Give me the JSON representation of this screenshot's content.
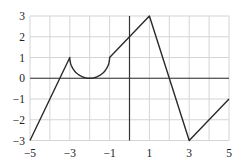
{
  "chart_data": {
    "type": "line",
    "title": "",
    "xlabel": "",
    "ylabel": "",
    "xlim": [
      -5,
      5
    ],
    "ylim": [
      -3,
      3
    ],
    "grid": true,
    "grid_step": 1,
    "x_ticks": [
      -5,
      -3,
      -1,
      1,
      3,
      5
    ],
    "x_tick_labels": [
      "−5",
      "−3",
      "−1",
      "1",
      "3",
      "5"
    ],
    "y_ticks": [
      -3,
      -2,
      -1,
      0,
      1,
      2,
      3
    ],
    "y_tick_labels": [
      "−3",
      "−2",
      "−1",
      "0",
      "1",
      "2",
      "3"
    ],
    "series": [
      {
        "name": "f(x)",
        "segments": [
          {
            "kind": "line",
            "from": [
              -5,
              -3
            ],
            "to": [
              -3,
              1
            ]
          },
          {
            "kind": "semicircle",
            "from": [
              -3,
              1
            ],
            "to": [
              -1,
              1
            ],
            "center": [
              -2,
              1
            ],
            "radius": 1,
            "side": "lower"
          },
          {
            "kind": "line",
            "from": [
              -1,
              1
            ],
            "to": [
              1,
              3
            ]
          },
          {
            "kind": "line",
            "from": [
              1,
              3
            ],
            "to": [
              3,
              -3
            ]
          },
          {
            "kind": "line",
            "from": [
              3,
              -3
            ],
            "to": [
              5,
              -1
            ]
          }
        ]
      }
    ]
  },
  "colors": {
    "grid": "#d4d4d4",
    "axis": "#333333",
    "curve": "#2a2a2a",
    "frame": "#d4d4d4"
  }
}
